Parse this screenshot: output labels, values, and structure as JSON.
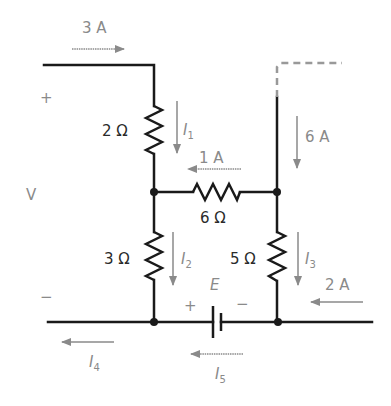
{
  "diagram": {
    "type": "circuit",
    "colors": {
      "wire": "#1a1a1a",
      "annotation": "#8a8a8a",
      "value_text": "#2a2a2a",
      "background": "#ffffff"
    },
    "source": {
      "voltage_label": "V",
      "plus_label": "+",
      "minus_label": "−"
    },
    "currents": {
      "input": "3 A",
      "middle": "1 A",
      "right_branch": "6 A",
      "bottom_right": "2 A",
      "I1": {
        "letter": "I",
        "sub": "1"
      },
      "I2": {
        "letter": "I",
        "sub": "2"
      },
      "I3": {
        "letter": "I",
        "sub": "3"
      },
      "I4": {
        "letter": "I",
        "sub": "4"
      },
      "I5": {
        "letter": "I",
        "sub": "5"
      }
    },
    "resistors": {
      "r1": "2 Ω",
      "r2": "6 Ω",
      "r3": "3 Ω",
      "r4": "5 Ω"
    },
    "battery": {
      "label": "E",
      "plus": "+",
      "minus": "−"
    }
  }
}
